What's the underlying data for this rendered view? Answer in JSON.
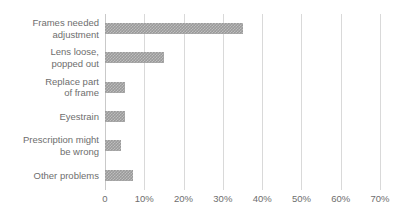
{
  "chart_data": {
    "type": "bar",
    "orientation": "horizontal",
    "title": "",
    "xlabel": "",
    "ylabel": "",
    "categories": [
      "Frames needed\nadjustment",
      "Lens loose,\npopped out",
      "Replace part\nof frame",
      "Eyestrain",
      "Prescription might\nbe wrong",
      "Other problems"
    ],
    "category_lines": [
      [
        "Frames needed",
        "adjustment"
      ],
      [
        "Lens loose,",
        "popped out"
      ],
      [
        "Replace part",
        "of frame"
      ],
      [
        "Eyestrain"
      ],
      [
        "Prescription might",
        "be wrong"
      ],
      [
        "Other problems"
      ]
    ],
    "values": [
      35,
      15,
      5,
      5,
      4,
      7
    ],
    "value_unit": "%",
    "xlim": [
      0,
      70
    ],
    "xticks": [
      0,
      10,
      20,
      30,
      40,
      50,
      60,
      70
    ],
    "xtick_labels": [
      "0",
      "10%",
      "20%",
      "30%",
      "40%",
      "50%",
      "60%",
      "70%"
    ],
    "grid": "vertical",
    "legend": "none",
    "bar_color": "#9a9a9a",
    "bar_pattern": "checkered",
    "gridline_color": "#d9d9d9",
    "text_color": "#6e6e6e",
    "background_color": "#ffffff"
  }
}
